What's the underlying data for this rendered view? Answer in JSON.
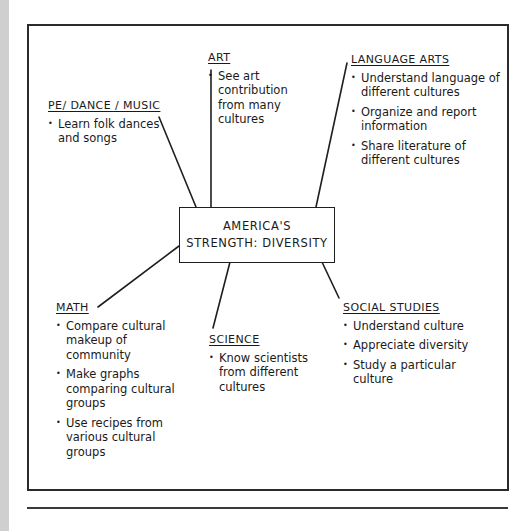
{
  "diagram": {
    "center": {
      "line1": "AMERICA'S",
      "line2": "STRENGTH: DIVERSITY"
    },
    "nodes": {
      "art": {
        "heading": "ART",
        "items": [
          "See art contribution from many cultures"
        ]
      },
      "pe_dance_music": {
        "heading": "PE/ DANCE / MUSIC",
        "items": [
          "Learn folk dances and songs"
        ]
      },
      "language_arts": {
        "heading": "LANGUAGE ARTS",
        "items": [
          "Understand language of different cultures",
          "Organize and report information",
          "Share literature of different cultures"
        ]
      },
      "math": {
        "heading": "MATH",
        "items": [
          "Compare cultural makeup of community",
          "Make graphs comparing cultural groups",
          "Use recipes from various cultural groups"
        ]
      },
      "science": {
        "heading": "SCIENCE",
        "items": [
          "Know scientists from different cultures"
        ]
      },
      "social_studies": {
        "heading": "SOCIAL STUDIES",
        "items": [
          "Understand culture",
          "Appreciate diversity",
          "Study a particular culture"
        ]
      }
    },
    "colors": {
      "ink": "#1f1f1f",
      "paper": "#ffffff",
      "side_strip": "#cfcfcf"
    }
  }
}
